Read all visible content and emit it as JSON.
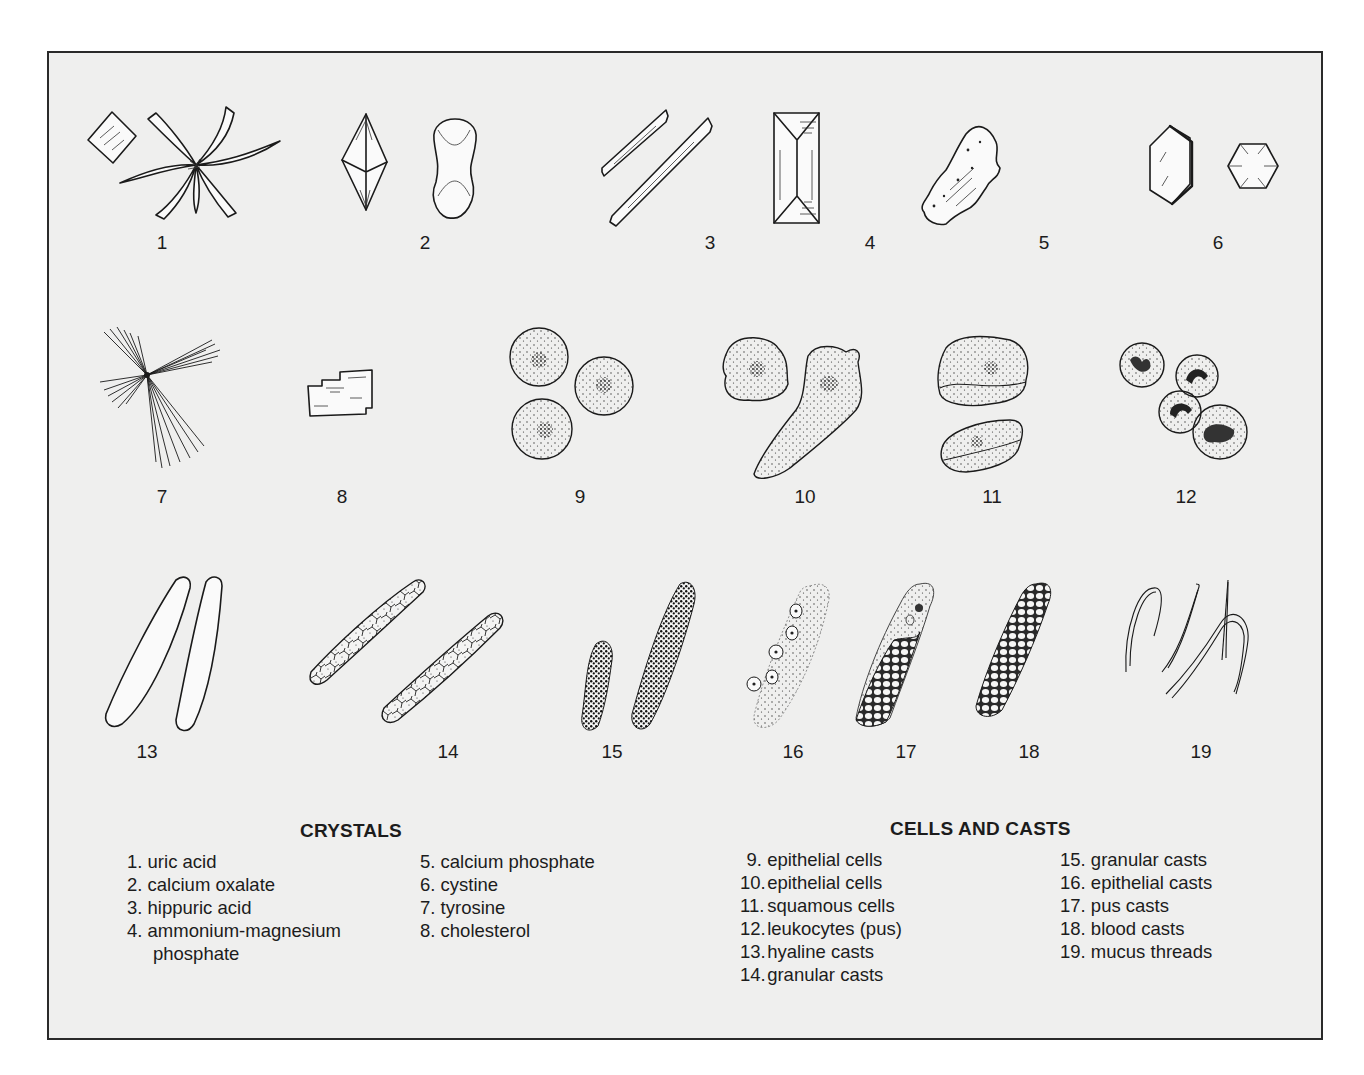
{
  "figure": {
    "panels": [
      {
        "id": 1,
        "label": "1"
      },
      {
        "id": 2,
        "label": "2"
      },
      {
        "id": 3,
        "label": "3"
      },
      {
        "id": 4,
        "label": "4"
      },
      {
        "id": 5,
        "label": "5"
      },
      {
        "id": 6,
        "label": "6"
      },
      {
        "id": 7,
        "label": "7"
      },
      {
        "id": 8,
        "label": "8"
      },
      {
        "id": 9,
        "label": "9"
      },
      {
        "id": 10,
        "label": "10"
      },
      {
        "id": 11,
        "label": "11"
      },
      {
        "id": 12,
        "label": "12"
      },
      {
        "id": 13,
        "label": "13"
      },
      {
        "id": 14,
        "label": "14"
      },
      {
        "id": 15,
        "label": "15"
      },
      {
        "id": 16,
        "label": "16"
      },
      {
        "id": 17,
        "label": "17"
      },
      {
        "id": 18,
        "label": "18"
      },
      {
        "id": 19,
        "label": "19"
      }
    ]
  },
  "legend": {
    "crystals": {
      "title": "CRYSTALS",
      "col1": [
        {
          "num": "1.",
          "text": "uric acid"
        },
        {
          "num": "2.",
          "text": "calcium oxalate"
        },
        {
          "num": "3.",
          "text": "hippuric acid"
        },
        {
          "num": "4.",
          "text": "ammonium-magnesium",
          "cont": "phosphate"
        }
      ],
      "col2": [
        {
          "num": "5.",
          "text": "calcium phosphate"
        },
        {
          "num": "6.",
          "text": "cystine"
        },
        {
          "num": "7.",
          "text": "tyrosine"
        },
        {
          "num": "8.",
          "text": "cholesterol"
        }
      ]
    },
    "cells_and_casts": {
      "title": "CELLS AND CASTS",
      "col1": [
        {
          "num": "9.",
          "text": "epithelial cells"
        },
        {
          "num": "10.",
          "text": "epithelial cells"
        },
        {
          "num": "11.",
          "text": "squamous cells"
        },
        {
          "num": "12.",
          "text": "leukocytes (pus)"
        },
        {
          "num": "13.",
          "text": "hyaline casts"
        },
        {
          "num": "14.",
          "text": "granular casts"
        }
      ],
      "col2": [
        {
          "num": "15.",
          "text": "granular casts"
        },
        {
          "num": "16.",
          "text": "epithelial casts"
        },
        {
          "num": "17.",
          "text": "pus casts"
        },
        {
          "num": "18.",
          "text": "blood casts"
        },
        {
          "num": "19.",
          "text": "mucus threads"
        }
      ]
    }
  },
  "colors": {
    "frame_border": "#2a2a2a",
    "panel_background": "#efefee",
    "ink": "#1a1a1a",
    "page_background": "#ffffff"
  }
}
